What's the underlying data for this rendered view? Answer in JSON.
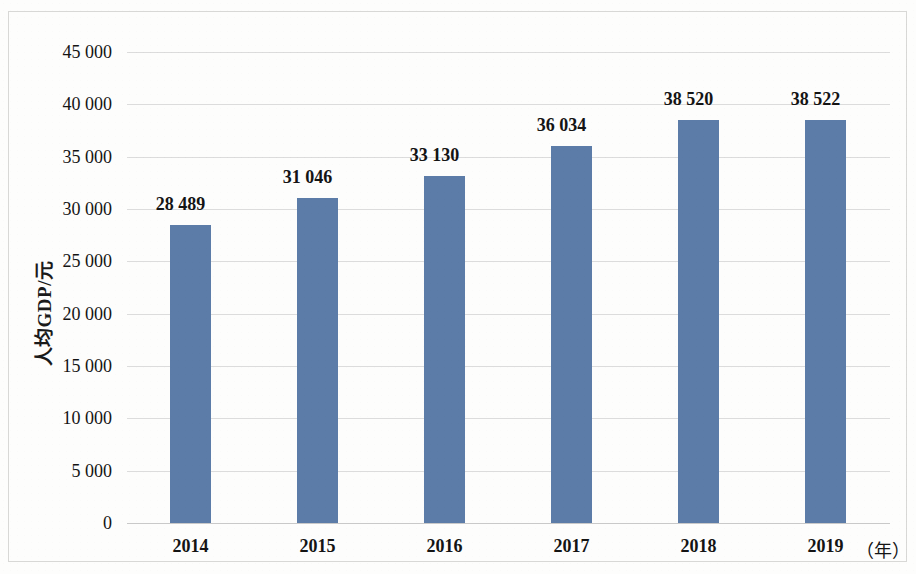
{
  "chart_data": {
    "type": "bar",
    "title": "",
    "subtitle": "",
    "xlabel": "（年）",
    "ylabel": "人均GDP/元",
    "categories": [
      "2014",
      "2015",
      "2016",
      "2017",
      "2018",
      "2019"
    ],
    "values": [
      28489,
      31046,
      33130,
      36034,
      38520,
      38522
    ],
    "value_labels": [
      "28 489",
      "31 046",
      "33 130",
      "36 034",
      "38 520",
      "38 522"
    ],
    "series": [
      {
        "name": "人均GDP/元",
        "values": [
          28489,
          31046,
          33130,
          36034,
          38520,
          38522
        ]
      }
    ],
    "ylim": [
      0,
      45000
    ],
    "ytick_values": [
      0,
      5000,
      10000,
      15000,
      20000,
      25000,
      30000,
      35000,
      40000,
      45000
    ],
    "ytick_labels": [
      "0",
      "5 000",
      "10 000",
      "15 000",
      "20 000",
      "25 000",
      "30 000",
      "35 000",
      "40 000",
      "45 000"
    ],
    "grid": "horizontal",
    "legend": "none",
    "bar_color": "#5c7ca8",
    "gridline_color": "#dcdcdc",
    "text_color": "#141414",
    "background_color": "#fdfdfc",
    "annotations": []
  }
}
